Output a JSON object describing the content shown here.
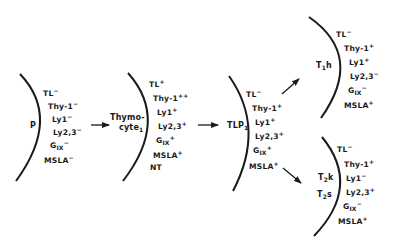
{
  "diagram": {
    "type": "cell-differentiation-pathway",
    "stroke_color": "#1a1a1a",
    "cells": [
      {
        "id": "P",
        "label": "P",
        "markers": [
          {
            "name": "TL",
            "sup": "−"
          },
          {
            "name": "Thy-1",
            "sup": "−"
          },
          {
            "name": "Ly1",
            "sup": "−"
          },
          {
            "name": "Ly2,3",
            "sup": "−"
          },
          {
            "name": "G",
            "sub": "IX",
            "sup": "−"
          },
          {
            "name": "MSLA",
            "sup": "−"
          }
        ]
      },
      {
        "id": "thymocyte1",
        "label_line1": "Thymo-",
        "label_line2": "cyte",
        "label_sub": "1",
        "markers": [
          {
            "name": "TL",
            "sup": "+"
          },
          {
            "name": "Thy-1",
            "sup": "++"
          },
          {
            "name": "Ly1",
            "sup": "+"
          },
          {
            "name": "Ly2,3",
            "sup": "+"
          },
          {
            "name": "G",
            "sub": "IX",
            "sup": "+"
          },
          {
            "name": "MSLA",
            "sup": "+"
          },
          {
            "name": "NT",
            "sup": ""
          }
        ]
      },
      {
        "id": "TLP1",
        "label": "TLP",
        "label_sub": "1",
        "markers": [
          {
            "name": "TL",
            "sup": "−"
          },
          {
            "name": "Thy-1",
            "sup": "+"
          },
          {
            "name": "Ly1",
            "sup": "+"
          },
          {
            "name": "Ly2,3",
            "sup": "+"
          },
          {
            "name": "G",
            "sub": "IX",
            "sup": "+"
          },
          {
            "name": "MSLA",
            "sup": "+"
          }
        ]
      },
      {
        "id": "T1h",
        "label_pre": "T",
        "label_sub": "1",
        "label_post": "h",
        "markers": [
          {
            "name": "TL",
            "sup": "−"
          },
          {
            "name": "Thy-1",
            "sup": "+"
          },
          {
            "name": "Ly1",
            "sup": "+"
          },
          {
            "name": "Ly2,3",
            "sup": "−"
          },
          {
            "name": "G",
            "sub": "IX",
            "sup": "−"
          },
          {
            "name": "MSLA",
            "sup": "+"
          }
        ]
      },
      {
        "id": "T2",
        "label1_pre": "T",
        "label1_sub": "2",
        "label1_post": "k",
        "label2_pre": "T",
        "label2_sub": "2",
        "label2_post": "s",
        "markers": [
          {
            "name": "TL",
            "sup": "−"
          },
          {
            "name": "Thy-1",
            "sup": "+"
          },
          {
            "name": "Ly1",
            "sup": "−"
          },
          {
            "name": "Ly2,3",
            "sup": "+"
          },
          {
            "name": "G",
            "sub": "IX",
            "sup": "−"
          },
          {
            "name": "MSLA",
            "sup": "+"
          }
        ]
      }
    ],
    "arrows": [
      {
        "from": "P",
        "to": "thymocyte1"
      },
      {
        "from": "thymocyte1",
        "to": "TLP1"
      },
      {
        "from": "TLP1",
        "to": "T1h"
      },
      {
        "from": "TLP1",
        "to": "T2"
      }
    ]
  }
}
